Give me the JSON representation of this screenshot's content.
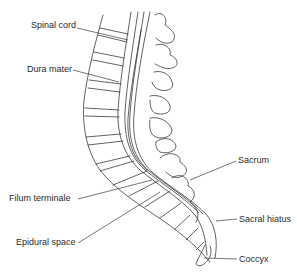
{
  "diagram": {
    "labels": {
      "spinal_cord": "Spinal cord",
      "dura_mater": "Dura mater",
      "filum_terminale": "Filum terminale",
      "epidural_space": "Epidural space",
      "sacrum": "Sacrum",
      "sacral_hiatus": "Sacral hiatus",
      "coccyx": "Coccyx"
    },
    "colors": {
      "line": "#3a3a3a",
      "text": "#2a2a2a",
      "background": "#ffffff"
    }
  }
}
